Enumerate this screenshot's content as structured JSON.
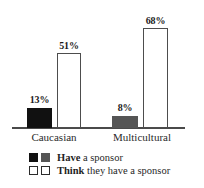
{
  "chart_data": {
    "type": "bar",
    "title": "",
    "subtitle": "",
    "xlabel": "",
    "ylabel": "",
    "ylim": [
      0,
      72
    ],
    "grid": false,
    "legend_position": "bottom",
    "categories": [
      "Caucasian",
      "Multicultural"
    ],
    "series": [
      {
        "name": "Have a sponsor",
        "values": [
          13,
          8
        ],
        "value_labels": [
          "13%",
          "8%"
        ],
        "colors": [
          "#111111",
          "#555555"
        ],
        "style": "filled"
      },
      {
        "name": "Think they have a sponsor",
        "values": [
          51,
          68
        ],
        "value_labels": [
          "51%",
          "68%"
        ],
        "colors": [
          "#ffffff",
          "#ffffff"
        ],
        "style": "outlined"
      }
    ],
    "annotations": []
  },
  "axis": {
    "categories": [
      {
        "label": "Caucasian"
      },
      {
        "label": "Multicultural"
      }
    ]
  },
  "bars": [
    {
      "group": "Caucasian",
      "series": "have",
      "label": "13%",
      "value": 13
    },
    {
      "group": "Caucasian",
      "series": "think",
      "label": "51%",
      "value": 51
    },
    {
      "group": "Multicultural",
      "series": "have",
      "label": "8%",
      "value": 8
    },
    {
      "group": "Multicultural",
      "series": "think",
      "label": "68%",
      "value": 68
    }
  ],
  "legend": {
    "rows": [
      {
        "bold_text": "Have",
        "rest_text": " a sponsor"
      },
      {
        "bold_text": "Think",
        "rest_text": " they have a sponsor"
      }
    ]
  },
  "colors": {
    "have_caucasian": "#111111",
    "have_multicultural": "#555555",
    "think_fill": "#ffffff",
    "think_stroke": "#4d4d4d",
    "axis": "#4a4a4a",
    "text": "#1f1f1f",
    "background": "#ffffff"
  }
}
